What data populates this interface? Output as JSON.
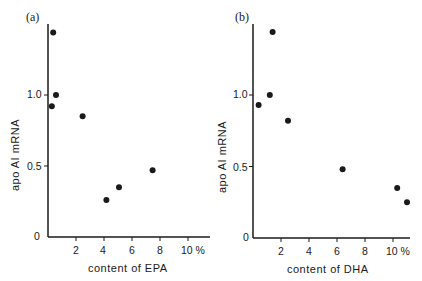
{
  "chart_data": [
    {
      "type": "scatter",
      "panel": "(a)",
      "xlabel": "content of EPA",
      "ylabel": "apo AI mRNA",
      "x_ticks": [
        "2",
        "4",
        "6",
        "8",
        "10 %"
      ],
      "y_ticks": [
        "0",
        "0.5",
        "1.0"
      ],
      "xlim": [
        0,
        11.5
      ],
      "ylim": [
        0,
        1.5
      ],
      "grid": false,
      "points": [
        {
          "x": 0.3,
          "y": 1.44
        },
        {
          "x": 0.5,
          "y": 1.0
        },
        {
          "x": 0.2,
          "y": 0.92
        },
        {
          "x": 2.4,
          "y": 0.85
        },
        {
          "x": 4.1,
          "y": 0.26
        },
        {
          "x": 5.0,
          "y": 0.35
        },
        {
          "x": 7.4,
          "y": 0.47
        }
      ]
    },
    {
      "type": "scatter",
      "panel": "(b)",
      "xlabel": "content of DHA",
      "ylabel": "apo AI mRNA",
      "x_ticks": [
        "2",
        "4",
        "6",
        "8",
        "10 %"
      ],
      "y_ticks": [
        "0",
        "0.5",
        "1.0"
      ],
      "xlim": [
        0,
        11.5
      ],
      "ylim": [
        0,
        1.5
      ],
      "grid": false,
      "points": [
        {
          "x": 1.4,
          "y": 1.44
        },
        {
          "x": 1.2,
          "y": 1.0
        },
        {
          "x": 0.4,
          "y": 0.93
        },
        {
          "x": 2.5,
          "y": 0.82
        },
        {
          "x": 6.4,
          "y": 0.48
        },
        {
          "x": 10.3,
          "y": 0.35
        },
        {
          "x": 11.0,
          "y": 0.25
        }
      ]
    }
  ],
  "panels": {
    "a": {
      "label": "(a)",
      "xlabel": "content of EPA",
      "ylabel": "apo AI mRNA",
      "yticks": {
        "t0": "0",
        "t05": "0.5",
        "t10": "1.0"
      },
      "xticks": {
        "t2": "2",
        "t4": "4",
        "t6": "6",
        "t8": "8",
        "t10": "10 %"
      }
    },
    "b": {
      "label": "(b)",
      "xlabel": "content of DHA",
      "ylabel": "apo AI mRNA",
      "yticks": {
        "t0": "0",
        "t05": "0.5",
        "t10": "1.0"
      },
      "xticks": {
        "t2": "2",
        "t4": "4",
        "t6": "6",
        "t8": "8",
        "t10": "10 %"
      }
    }
  },
  "colors": {
    "ink": "#1a1a1a",
    "background": "#ffffff"
  }
}
